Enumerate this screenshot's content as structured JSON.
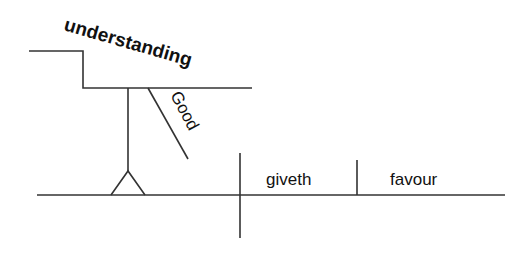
{
  "diagram": {
    "type": "sentence-diagram",
    "subject": "understanding",
    "subject_modifier": "Good",
    "verb": "giveth",
    "object": "favour",
    "line_color": "#333333",
    "text_color": "#111111"
  }
}
